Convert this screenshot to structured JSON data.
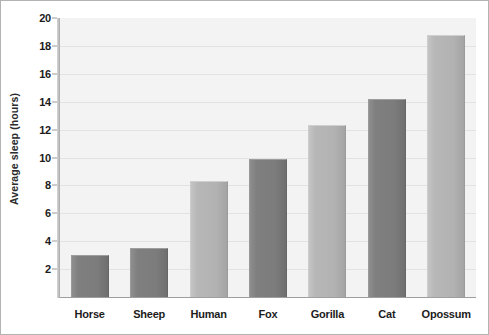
{
  "chart_data": {
    "type": "bar",
    "title": "",
    "xlabel": "",
    "ylabel": "Average sleep (hours)",
    "categories": [
      "Horse",
      "Sheep",
      "Human",
      "Fox",
      "Gorilla",
      "Cat",
      "Opossum"
    ],
    "values": [
      3.0,
      3.5,
      8.3,
      9.9,
      12.3,
      14.2,
      18.8
    ],
    "bar_shades": [
      "dark",
      "dark",
      "light",
      "dark",
      "light",
      "dark",
      "light"
    ],
    "ylim": [
      0,
      20
    ],
    "yticks": [
      2,
      4,
      6,
      8,
      10,
      12,
      14,
      16,
      18,
      20
    ],
    "ytick_labels": [
      "2",
      "4",
      "6",
      "8",
      "10",
      "12",
      "14",
      "16",
      "18",
      "20"
    ],
    "grid": true,
    "legend": "none",
    "colors": {
      "bar_light": "#b2b2b2",
      "bar_dark": "#7c7c7c",
      "plot_background": "#f3f3f3",
      "gridline": "#e2e2e2",
      "axis": "#9e9e9e",
      "text": "#1c1c1c",
      "border": "#b3b3b3"
    }
  }
}
